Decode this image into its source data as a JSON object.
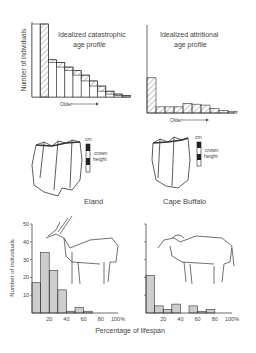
{
  "panels": {
    "catastrophic": {
      "title_line1": "Idealized catastrophic",
      "title_line2": "age profile",
      "ylabel": "Number of individuals",
      "xlabel": "Older"
    },
    "attritional": {
      "title_line1": "Idealized attritional",
      "title_line2": "age profile",
      "xlabel": "Older"
    },
    "teeth": {
      "eland_label": "Eland",
      "buffalo_label": "Cape Buffalo",
      "scale_unit": "cm",
      "scale_caption_line1": "crown",
      "scale_caption_line2": "height"
    },
    "bottom": {
      "ylabel": "Number of individuals",
      "xlabel": "Percentage of lifespan",
      "yticks": [
        "10",
        "20",
        "30",
        "40",
        "50"
      ],
      "xticks": [
        "20",
        "40",
        "60",
        "80",
        "100%"
      ]
    }
  },
  "chart_data": [
    {
      "type": "bar",
      "title": "Idealized catastrophic age profile",
      "xlabel": "Older",
      "ylabel": "Number of individuals",
      "categories": [
        "1",
        "2",
        "3",
        "4",
        "5",
        "6",
        "7",
        "8",
        "9",
        "10",
        "11",
        "12"
      ],
      "values": [
        100,
        100,
        51,
        47,
        41,
        36,
        30,
        22,
        15,
        8,
        4,
        2
      ],
      "hatched_portion": "top segment of each bar shows decrement to next class",
      "grid": false
    },
    {
      "type": "bar",
      "title": "Idealized attritional age profile",
      "xlabel": "Older",
      "ylabel": "Number of individuals",
      "categories": [
        "1",
        "2",
        "3",
        "4",
        "5",
        "6",
        "7",
        "8",
        "9",
        "10"
      ],
      "values": [
        40,
        7,
        7,
        7,
        11,
        10,
        9,
        5,
        3,
        2
      ],
      "grid": false
    },
    {
      "type": "bar",
      "title": "Eland",
      "xlabel": "Percentage of lifespan",
      "ylabel": "Number of individuals",
      "categories": [
        "0-10",
        "10-20",
        "20-30",
        "30-40",
        "40-50",
        "50-60",
        "60-70",
        "70-80",
        "80-90",
        "90-100"
      ],
      "values": [
        17,
        34,
        24,
        13,
        1,
        3,
        1,
        0,
        0,
        0
      ],
      "ylim": [
        0,
        50
      ],
      "yticks": [
        10,
        20,
        30,
        40,
        50
      ],
      "xticks": [
        "20",
        "40",
        "60",
        "80",
        "100%"
      ]
    },
    {
      "type": "bar",
      "title": "Cape Buffalo",
      "xlabel": "Percentage of lifespan",
      "ylabel": "Number of individuals",
      "categories": [
        "0-10",
        "10-20",
        "20-30",
        "30-40",
        "40-50",
        "50-60",
        "60-70",
        "70-80",
        "80-90",
        "90-100"
      ],
      "values": [
        21,
        4,
        2,
        5,
        0,
        4,
        1,
        2,
        0,
        0
      ],
      "ylim": [
        0,
        50
      ],
      "yticks": [
        10,
        20,
        30,
        40,
        50
      ],
      "xticks": [
        "20",
        "40",
        "60",
        "80",
        "100%"
      ]
    }
  ]
}
